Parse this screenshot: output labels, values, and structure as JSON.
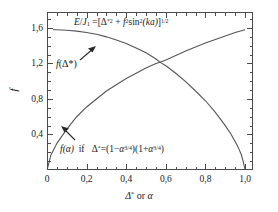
{
  "chart_data": {
    "type": "line",
    "title": "",
    "xlabel": "Δ* or α",
    "ylabel": "f",
    "xlim": [
      0,
      1.04
    ],
    "ylim": [
      0,
      1.78
    ],
    "grid": false,
    "legend_position": "in-plot annotations",
    "x_ticks": [
      "0",
      "0,2",
      "0,4",
      "0,6",
      "0,8",
      "1,0"
    ],
    "x_tick_values": [
      0,
      0.2,
      0.4,
      0.6,
      0.8,
      1.0
    ],
    "y_ticks": [
      "0,4",
      "0,8",
      "1,2",
      "1,6"
    ],
    "y_tick_values": [
      0.4,
      0.8,
      1.2,
      1.6
    ],
    "series": [
      {
        "name": "f(Δ*)",
        "label_text": "f(Δ*)",
        "x": [
          0.03,
          0.05,
          0.1,
          0.15,
          0.2,
          0.25,
          0.3,
          0.35,
          0.4,
          0.45,
          0.5,
          0.55,
          0.57,
          0.6,
          0.65,
          0.7,
          0.75,
          0.8,
          0.85,
          0.9,
          0.93,
          0.96,
          0.98,
          0.99,
          1.0
        ],
        "y": [
          1.58,
          1.58,
          1.575,
          1.565,
          1.55,
          1.53,
          1.5,
          1.465,
          1.425,
          1.375,
          1.32,
          1.25,
          1.215,
          1.175,
          1.09,
          0.995,
          0.89,
          0.78,
          0.65,
          0.5,
          0.4,
          0.28,
          0.18,
          0.1,
          0.0
        ]
      },
      {
        "name": "f(α)",
        "label_text": "f(α)",
        "x": [
          0.0,
          0.02,
          0.05,
          0.1,
          0.15,
          0.2,
          0.25,
          0.3,
          0.35,
          0.4,
          0.45,
          0.5,
          0.55,
          0.57,
          0.6,
          0.65,
          0.7,
          0.75,
          0.8,
          0.85,
          0.9,
          0.95,
          1.0
        ],
        "y": [
          0.0,
          0.17,
          0.3,
          0.46,
          0.6,
          0.71,
          0.8,
          0.89,
          0.96,
          1.03,
          1.09,
          1.15,
          1.2,
          1.215,
          1.24,
          1.29,
          1.34,
          1.385,
          1.43,
          1.47,
          1.51,
          1.55,
          1.58
        ]
      }
    ],
    "annotations": [
      {
        "id": "top-equation",
        "text": "E/J₁ = [Δ*² + f² sin²(ka)]^(1/2)",
        "position": "top-center-inside"
      },
      {
        "id": "upper-curve-label",
        "text": "f(Δ*)",
        "position": "left-inside",
        "arrow": "points up-right to descending curve"
      },
      {
        "id": "bottom-equation",
        "text": "f(α)  if   Δ* = (1−α^(3/4))(1+α^(3/4))",
        "position": "bottom-inside",
        "arrow": "points up-left to rising curve"
      }
    ],
    "colors": {
      "curve": "#55555a",
      "axis": "#4a4a4a",
      "text": "#1a1a1a",
      "background": "#ffffff"
    }
  },
  "equations": {
    "top": {
      "lhs_var": "E",
      "lhs_den": "J",
      "lhs_den_sub": "1",
      "eq": "=",
      "open": "[",
      "t1_sym": "Δ",
      "t1_star": "*2",
      "plus": "+",
      "t2_f": "f",
      "t2_exp": "2",
      "sin": "sin",
      "sin_exp": "2",
      "sin_arg": "(ka)",
      "close": "]",
      "close_exp": "1/2"
    },
    "bottom": {
      "fn": "f",
      "fn_arg": "(α)",
      "if": "if",
      "delta": "Δ",
      "star": "*",
      "eq": "=",
      "p1_open": "(1−",
      "p1_base": "α",
      "p1_exp": "3/4",
      "p1_close": ")",
      "p2_open": "(1+",
      "p2_base": "α",
      "p2_exp": "3/4",
      "p2_close": ")"
    }
  },
  "labels": {
    "upper_curve": {
      "fn": "f",
      "arg": "(Δ*)"
    },
    "y_axis": "f",
    "x_axis": {
      "delta": "Δ",
      "star": "*",
      "or": "or",
      "alpha": "α"
    }
  }
}
